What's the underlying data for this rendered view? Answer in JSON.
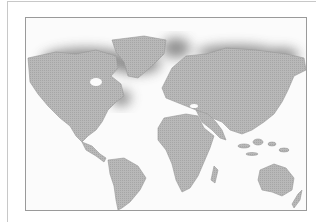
{
  "image": {
    "subject": "world map",
    "style": "grayscale stippled landmass on white background with dark blurred shading along northern regions",
    "colors": {
      "land": "#b4b4b4",
      "land_dark": "#8a8a8a",
      "shadow": "#7a7a7a",
      "ocean": "#fbfbfb",
      "frame": "#9a9a9a",
      "outer_frame": "#c8c8c8"
    },
    "regions": [
      "North America",
      "Greenland",
      "South America",
      "Europe",
      "Africa",
      "Asia",
      "Australia",
      "New Zealand",
      "Madagascar",
      "Indonesia"
    ]
  }
}
